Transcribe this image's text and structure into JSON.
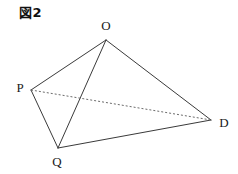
{
  "figure": {
    "caption": "図2",
    "background_color": "#ffffff",
    "solid_edge_color": "#3a3a3a",
    "hidden_edge_color": "#6b6b6b"
  },
  "vertices": [
    {
      "id": "O",
      "label": "O",
      "x": 106,
      "y": 40,
      "label_x": 106,
      "label_y": 30
    },
    {
      "id": "P",
      "label": "P",
      "x": 31,
      "y": 90,
      "label_x": 20,
      "label_y": 92
    },
    {
      "id": "Q",
      "label": "Q",
      "x": 58,
      "y": 148,
      "label_x": 57,
      "label_y": 166
    },
    {
      "id": "D",
      "label": "D",
      "x": 211,
      "y": 120,
      "label_x": 224,
      "label_y": 127
    }
  ],
  "edges": [
    {
      "id": "O-P",
      "from": "O",
      "to": "P",
      "style": "solid"
    },
    {
      "id": "O-Q",
      "from": "O",
      "to": "Q",
      "style": "solid"
    },
    {
      "id": "O-D",
      "from": "O",
      "to": "D",
      "style": "solid"
    },
    {
      "id": "P-Q",
      "from": "P",
      "to": "Q",
      "style": "solid"
    },
    {
      "id": "Q-D",
      "from": "Q",
      "to": "D",
      "style": "solid"
    },
    {
      "id": "P-D",
      "from": "P",
      "to": "D",
      "style": "dotted"
    }
  ],
  "chart_data": {
    "type": "diagram",
    "title": "図2",
    "shape": "tetrahedron",
    "points": {
      "O": [
        106,
        40
      ],
      "P": [
        31,
        90
      ],
      "Q": [
        58,
        148
      ],
      "D": [
        211,
        120
      ]
    },
    "solid_edges": [
      [
        "O",
        "P"
      ],
      [
        "O",
        "Q"
      ],
      [
        "O",
        "D"
      ],
      [
        "P",
        "Q"
      ],
      [
        "Q",
        "D"
      ]
    ],
    "dotted_edges": [
      [
        "P",
        "D"
      ]
    ]
  }
}
